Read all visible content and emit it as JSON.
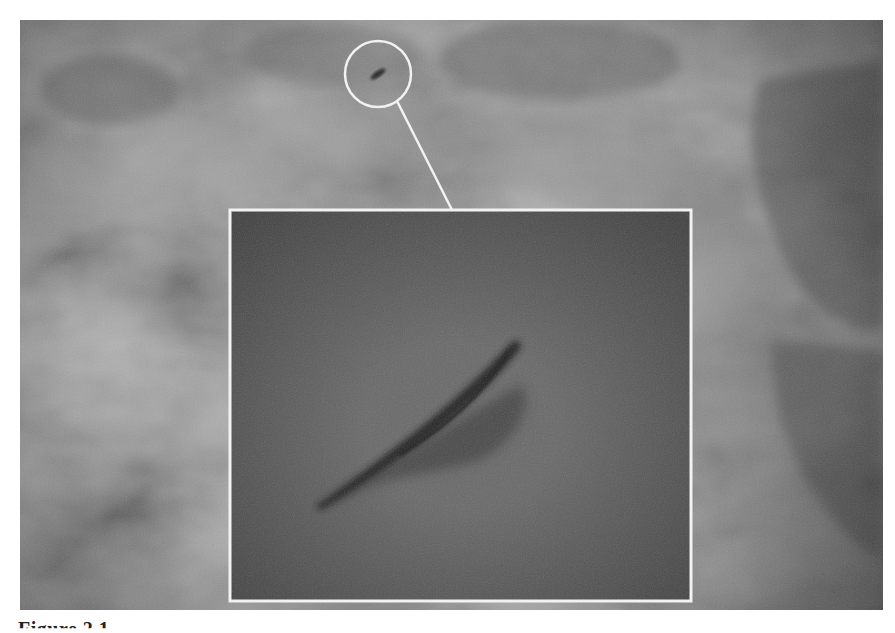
{
  "figure": {
    "caption": "Figure 2.1",
    "callout": {
      "circle_center": [
        378,
        74
      ],
      "circle_radius": 33,
      "inset_box": [
        230,
        210,
        691,
        601
      ]
    },
    "colors": {
      "sky_base": "#7b7b7b",
      "sky_dark": "#555555",
      "sky_light": "#a0a0a0",
      "inset_base": "#5e5e5e",
      "callout_stroke": "#f2f2f2",
      "object": "#2a2a2a"
    }
  }
}
